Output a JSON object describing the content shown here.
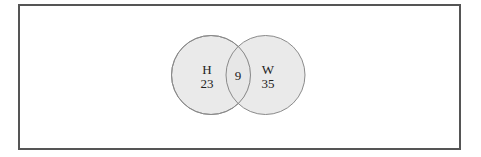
{
  "diagram": {
    "type": "venn",
    "sets": [
      {
        "label": "H",
        "only_count": "23"
      },
      {
        "label": "W",
        "only_count": "35"
      }
    ],
    "intersection": {
      "count": "9"
    },
    "colors": {
      "circle_fill": "#e6e6e6",
      "circle_stroke": "#8a8a8a",
      "frame_border": "#555555",
      "text": "#222222"
    }
  }
}
